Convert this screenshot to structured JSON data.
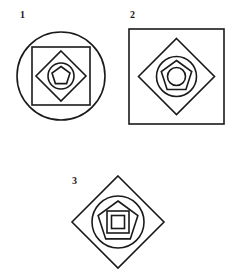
{
  "page": {
    "background_color": "#ffffff",
    "stroke_color": "#1a1a1a",
    "width": 236,
    "height": 278
  },
  "figures": [
    {
      "label": "1",
      "outer_shape": "circle",
      "nesting_order": [
        "circle",
        "square",
        "diamond",
        "circle",
        "pentagon"
      ],
      "shape_count": 5,
      "outer_size": 88,
      "shapes": [
        {
          "name": "outer-circle",
          "type": "circle",
          "size": 88
        },
        {
          "name": "square",
          "type": "square",
          "size": 58
        },
        {
          "name": "diamond",
          "type": "diamond",
          "size": 50
        },
        {
          "name": "inner-circle",
          "type": "circle",
          "size": 26
        },
        {
          "name": "pentagon",
          "type": "pentagon",
          "size": 19
        }
      ]
    },
    {
      "label": "2",
      "outer_shape": "square",
      "nesting_order": [
        "square",
        "diamond",
        "circle",
        "pentagon",
        "circle"
      ],
      "shape_count": 5,
      "outer_size": 95,
      "shapes": [
        {
          "name": "outer-square",
          "type": "square",
          "size": 95
        },
        {
          "name": "diamond",
          "type": "diamond",
          "size": 76
        },
        {
          "name": "circle",
          "type": "circle",
          "size": 40
        },
        {
          "name": "pentagon",
          "type": "pentagon",
          "size": 32
        },
        {
          "name": "inner-circle",
          "type": "circle",
          "size": 18
        }
      ]
    },
    {
      "label": "3",
      "outer_shape": "diamond",
      "nesting_order": [
        "diamond",
        "circle",
        "pentagon",
        "square",
        "square"
      ],
      "shape_count": 5,
      "outer_size": 92,
      "shapes": [
        {
          "name": "outer-diamond",
          "type": "diamond",
          "size": 92
        },
        {
          "name": "circle",
          "type": "circle",
          "size": 52
        },
        {
          "name": "pentagon",
          "type": "pentagon",
          "size": 42
        },
        {
          "name": "outer-square",
          "type": "square",
          "size": 22
        },
        {
          "name": "inner-square",
          "type": "square",
          "size": 13
        }
      ]
    }
  ]
}
